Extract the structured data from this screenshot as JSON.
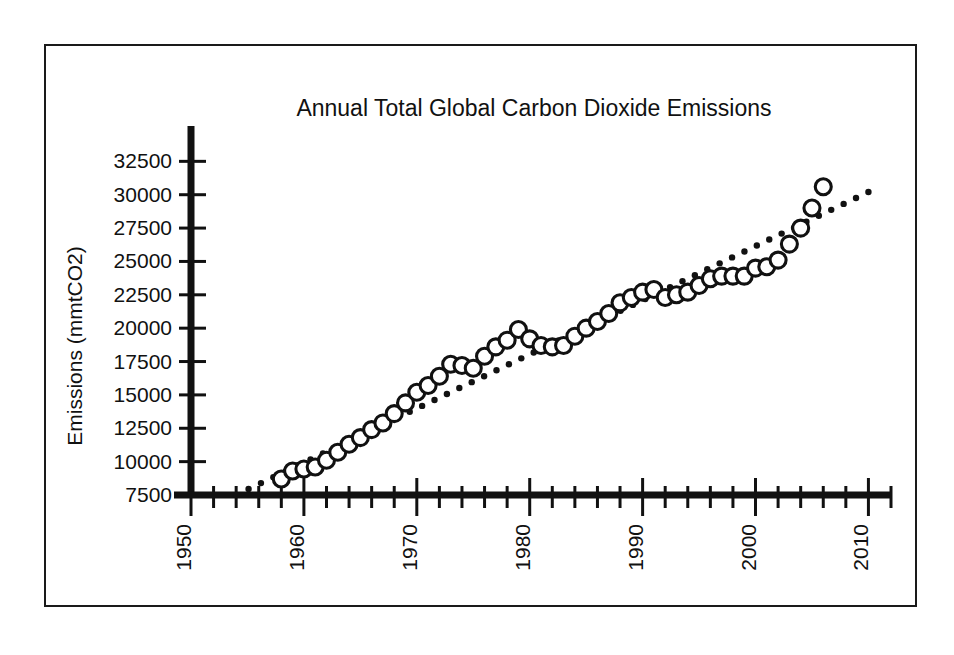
{
  "figure": {
    "frame_visible": true,
    "background_color": "#ffffff",
    "ink_color": "#111111"
  },
  "chart_data": {
    "type": "scatter",
    "title": "Annual Total Global Carbon Dioxide Emissions",
    "xlabel": "",
    "ylabel": "Emissions (mmtCO2)",
    "xlim": [
      1950,
      2012
    ],
    "ylim": [
      7500,
      33500
    ],
    "grid": false,
    "legend": null,
    "x_tick_labels": [
      "1950",
      "1960",
      "1970",
      "1980",
      "1990",
      "2000",
      "2010"
    ],
    "x_major_ticks": [
      1950,
      1960,
      1970,
      1980,
      1990,
      2000,
      2010
    ],
    "x_minor_tick_step": 2,
    "y_tick_labels": [
      "7500",
      "10000",
      "12500",
      "15000",
      "17500",
      "20000",
      "22500",
      "25000",
      "27500",
      "30000",
      "32500"
    ],
    "y_major_ticks": [
      7500,
      10000,
      12500,
      15000,
      17500,
      20000,
      22500,
      25000,
      27500,
      30000,
      32500
    ],
    "marker_style": "open-circle",
    "series": [
      {
        "name": "Annual total global CO2 emissions",
        "marker": "open-circle",
        "x": [
          1958,
          1959,
          1960,
          1961,
          1962,
          1963,
          1964,
          1965,
          1966,
          1967,
          1968,
          1969,
          1970,
          1971,
          1972,
          1973,
          1974,
          1975,
          1976,
          1977,
          1978,
          1979,
          1980,
          1981,
          1982,
          1983,
          1984,
          1985,
          1986,
          1987,
          1988,
          1989,
          1990,
          1991,
          1992,
          1993,
          1994,
          1995,
          1996,
          1997,
          1998,
          1999,
          2000,
          2001,
          2002,
          2003,
          2004,
          2005,
          2006
        ],
        "values": [
          8700,
          9300,
          9450,
          9600,
          10100,
          10700,
          11300,
          11800,
          12400,
          12900,
          13600,
          14400,
          15200,
          15700,
          16400,
          17300,
          17200,
          17000,
          17900,
          18600,
          19100,
          19900,
          19200,
          18700,
          18600,
          18700,
          19400,
          20000,
          20500,
          21100,
          21900,
          22300,
          22700,
          22900,
          22300,
          22500,
          22700,
          23200,
          23700,
          23900,
          23900,
          23900,
          24500,
          24600,
          25100,
          26300,
          27500,
          29000,
          30600
        ]
      }
    ],
    "trendline": {
      "name": "linear trend (dotted)",
      "style": "dotted",
      "x_start": 1954,
      "y_start": 7500,
      "x_end": 2010,
      "y_end": 30200
    }
  }
}
